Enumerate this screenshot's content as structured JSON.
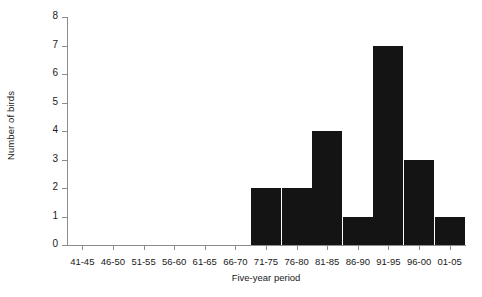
{
  "chart_data": {
    "type": "bar",
    "title": "",
    "xlabel": "Five-year period",
    "ylabel": "Number of birds",
    "categories": [
      "41-45",
      "46-50",
      "51-55",
      "56-60",
      "61-65",
      "66-70",
      "71-75",
      "76-80",
      "81-85",
      "86-90",
      "91-95",
      "96-00",
      "01-05"
    ],
    "values": [
      0,
      0,
      0,
      0,
      0,
      0,
      2,
      2,
      4,
      1,
      7,
      3,
      1
    ],
    "ylim": [
      0,
      8
    ],
    "yticks": [
      0,
      1,
      2,
      3,
      4,
      5,
      6,
      7,
      8
    ],
    "ytick_labels": [
      "0",
      "1",
      "2",
      "3",
      "4",
      "5",
      "6",
      "7",
      "8"
    ],
    "grid": false,
    "legend": null,
    "bar_color": "#141414",
    "axis_color": "#8c8c8c"
  }
}
